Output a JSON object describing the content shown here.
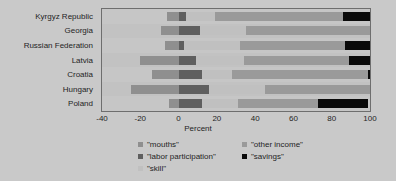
{
  "chart_data": {
    "type": "bar",
    "orientation": "horizontal",
    "stacked": true,
    "title": "",
    "xlabel": "Percent",
    "ylabel": "",
    "xlim": [
      -40,
      100
    ],
    "xticks": [
      -40,
      -20,
      0,
      20,
      40,
      60,
      80,
      100
    ],
    "xtick_labels": [
      "-40",
      "-20",
      "0",
      "20",
      "40",
      "60",
      "80",
      "100"
    ],
    "grid": true,
    "grid_axis": "x",
    "legend_position": "bottom",
    "categories": [
      "Kyrgyz Republic",
      "Georgia",
      "Russian Federation",
      "Latvia",
      "Croatia",
      "Hungary",
      "Poland"
    ],
    "series": [
      {
        "name": "\"mouths\"",
        "color": "#8f8f8f",
        "values": [
          -6,
          -9,
          -7,
          -20,
          -14,
          -25,
          -5
        ]
      },
      {
        "name": "\"labor participation\"",
        "color": "#5f5f5f",
        "values": [
          4,
          11,
          3,
          9,
          12,
          16,
          12
        ]
      },
      {
        "name": "\"skill\"",
        "color": "#c0c0c0",
        "values": [
          15,
          24,
          29,
          25,
          16,
          29,
          19
        ]
      },
      {
        "name": "\"other income\"",
        "color": "#9a9a9a",
        "values": [
          67,
          76,
          55,
          55,
          71,
          60,
          42
        ]
      },
      {
        "name": "\"savings\"",
        "color": "#0a0a0a",
        "values": [
          19,
          12,
          21,
          16,
          11,
          12,
          26
        ]
      }
    ],
    "legend_entries": [
      {
        "label": "\"mouths\"",
        "color": "#8f8f8f"
      },
      {
        "label": "\"labor participation\"",
        "color": "#5f5f5f"
      },
      {
        "label": "\"skill\"",
        "color": "#c0c0c0"
      },
      {
        "label": "\"other income\"",
        "color": "#9a9a9a"
      },
      {
        "label": "\"savings\"",
        "color": "#0a0a0a"
      }
    ]
  },
  "axis": {
    "x_title": "Percent",
    "ticks": [
      {
        "label": "-40"
      },
      {
        "label": "-20"
      },
      {
        "label": "0"
      },
      {
        "label": "20"
      },
      {
        "label": "40"
      },
      {
        "label": "60"
      },
      {
        "label": "80"
      },
      {
        "label": "100"
      }
    ]
  },
  "rows": [
    {
      "label": "Kyrgyz Republic"
    },
    {
      "label": "Georgia"
    },
    {
      "label": "Russian Federation"
    },
    {
      "label": "Latvia"
    },
    {
      "label": "Croatia"
    },
    {
      "label": "Hungary"
    },
    {
      "label": "Poland"
    }
  ],
  "legend": {
    "column1": [
      {
        "label": "\"mouths\""
      },
      {
        "label": "\"labor participation\""
      },
      {
        "label": "\"skill\""
      }
    ],
    "column2": [
      {
        "label": "\"other income\""
      },
      {
        "label": "\"savings\""
      }
    ]
  }
}
